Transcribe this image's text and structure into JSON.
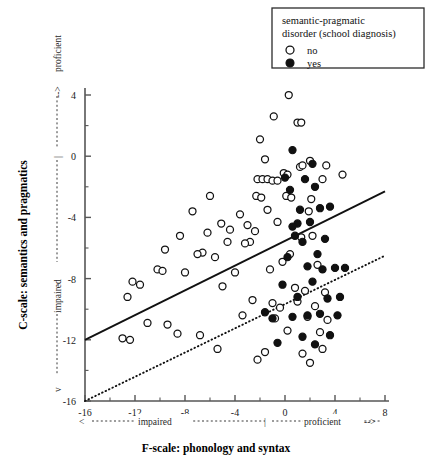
{
  "chart_data": {
    "type": "scatter",
    "title": "",
    "xlabel": "F-scale: phonology and syntax",
    "ylabel": "C-scale: semantics and pragmatics",
    "xlim": [
      -16,
      8
    ],
    "ylim": [
      -16,
      4
    ],
    "xticks": [
      -16,
      -12,
      -8,
      -4,
      0,
      4,
      8
    ],
    "yticks": [
      -16,
      -12,
      -8,
      -4,
      0,
      4
    ],
    "xtick_labels": [
      "-16",
      "-12",
      "-8",
      "-4",
      "0",
      "4",
      "8"
    ],
    "ytick_labels": [
      "-16",
      "-12",
      "-8",
      "-4",
      "0",
      "4"
    ],
    "minor_tick_step": 2,
    "grid": false,
    "x_axis_annotation": {
      "left_label": "impaired",
      "right_label": "proficient",
      "left_arrow": "<",
      "right_arrow": "-->",
      "midpoint_mark": "|"
    },
    "y_axis_annotation": {
      "low_label": "impaired",
      "high_label": "proficient",
      "low_arrow": "v",
      "high_arrow": "-->",
      "midpoint_mark": "|"
    },
    "legend": {
      "position": "top-right",
      "title_line1": "semantic-pragmatic",
      "title_line2": "disorder (school diagnosis)",
      "entries": [
        {
          "label": "no",
          "marker": "open-circle"
        },
        {
          "label": "yes",
          "marker": "filled-circle"
        }
      ]
    },
    "series": [
      {
        "name": "no",
        "marker": "open-circle",
        "color": "#ffffff",
        "edge_color": "#111111",
        "points": [
          [
            0.3,
            4.0
          ],
          [
            -0.9,
            2.6
          ],
          [
            1.0,
            2.2
          ],
          [
            1.3,
            2.2
          ],
          [
            -2.0,
            1.1
          ],
          [
            -1.6,
            -0.2
          ],
          [
            2.0,
            -0.3
          ],
          [
            1.2,
            -0.7
          ],
          [
            1.4,
            -0.6
          ],
          [
            3.3,
            -0.6
          ],
          [
            -0.1,
            -1.1
          ],
          [
            0.2,
            -1.2
          ],
          [
            -2.2,
            -1.5
          ],
          [
            -1.8,
            -1.5
          ],
          [
            -1.4,
            -1.5
          ],
          [
            -1.0,
            -1.6
          ],
          [
            -0.6,
            -1.6
          ],
          [
            3.0,
            -1.5
          ],
          [
            4.6,
            -1.2
          ],
          [
            -2.3,
            -2.6
          ],
          [
            -1.9,
            -2.7
          ],
          [
            0.1,
            -2.6
          ],
          [
            0.5,
            -2.7
          ],
          [
            2.1,
            -2.8
          ],
          [
            -6.0,
            -2.6
          ],
          [
            -1.4,
            -3.5
          ],
          [
            -3.6,
            -3.8
          ],
          [
            1.9,
            -3.6
          ],
          [
            -7.4,
            -3.6
          ],
          [
            -0.6,
            -4.3
          ],
          [
            -3.0,
            -4.5
          ],
          [
            -5.1,
            -4.4
          ],
          [
            -4.4,
            -4.8
          ],
          [
            -2.4,
            -4.9
          ],
          [
            -6.2,
            -5.0
          ],
          [
            -2.8,
            -5.6
          ],
          [
            -3.2,
            -5.7
          ],
          [
            -4.6,
            -5.6
          ],
          [
            -8.4,
            -5.2
          ],
          [
            1.3,
            -5.3
          ],
          [
            2.2,
            -5.2
          ],
          [
            -6.6,
            -6.3
          ],
          [
            -7.0,
            -6.4
          ],
          [
            -5.6,
            -6.6
          ],
          [
            -9.6,
            -6.1
          ],
          [
            0.4,
            -6.4
          ],
          [
            -0.2,
            -6.9
          ],
          [
            -10.2,
            -7.4
          ],
          [
            -9.8,
            -7.5
          ],
          [
            -8.0,
            -7.6
          ],
          [
            -4.0,
            -7.6
          ],
          [
            -1.2,
            -7.4
          ],
          [
            2.6,
            -7.1
          ],
          [
            -12.2,
            -8.2
          ],
          [
            -11.6,
            -8.4
          ],
          [
            -5.0,
            -8.5
          ],
          [
            0.8,
            -8.6
          ],
          [
            1.6,
            -8.8
          ],
          [
            3.2,
            -8.9
          ],
          [
            -2.6,
            -9.4
          ],
          [
            -1.0,
            -9.6
          ],
          [
            -0.4,
            -9.9
          ],
          [
            1.0,
            -9.5
          ],
          [
            2.4,
            -9.8
          ],
          [
            -12.6,
            -9.2
          ],
          [
            -3.4,
            -10.4
          ],
          [
            -0.8,
            -10.6
          ],
          [
            1.8,
            -10.5
          ],
          [
            3.4,
            -10.7
          ],
          [
            -11.0,
            -10.9
          ],
          [
            -9.4,
            -11.0
          ],
          [
            -8.6,
            -11.6
          ],
          [
            -6.8,
            -11.7
          ],
          [
            0.2,
            -11.4
          ],
          [
            2.8,
            -11.5
          ],
          [
            -13.0,
            -11.9
          ],
          [
            -12.4,
            -12.0
          ],
          [
            -5.4,
            -12.6
          ],
          [
            -1.6,
            -12.8
          ],
          [
            1.4,
            -12.9
          ],
          [
            3.0,
            -12.6
          ],
          [
            -2.2,
            -13.3
          ],
          [
            2.0,
            -13.5
          ]
        ]
      },
      {
        "name": "yes",
        "marker": "filled-circle",
        "color": "#111111",
        "edge_color": "#111111",
        "points": [
          [
            0.6,
            0.4
          ],
          [
            2.2,
            -0.5
          ],
          [
            0.0,
            -1.4
          ],
          [
            1.6,
            -1.5
          ],
          [
            2.4,
            -2.0
          ],
          [
            0.4,
            -2.2
          ],
          [
            2.8,
            -3.4
          ],
          [
            3.6,
            -3.3
          ],
          [
            1.2,
            -3.5
          ],
          [
            1.0,
            -4.4
          ],
          [
            0.6,
            -4.6
          ],
          [
            2.0,
            -4.3
          ],
          [
            0.8,
            -5.2
          ],
          [
            1.4,
            -5.6
          ],
          [
            3.2,
            -5.4
          ],
          [
            2.6,
            -6.4
          ],
          [
            0.2,
            -6.6
          ],
          [
            1.8,
            -7.2
          ],
          [
            3.0,
            -7.4
          ],
          [
            4.0,
            -7.3
          ],
          [
            4.8,
            -7.3
          ],
          [
            2.2,
            -8.2
          ],
          [
            -0.2,
            -8.4
          ],
          [
            1.0,
            -9.2
          ],
          [
            3.4,
            -9.3
          ],
          [
            4.4,
            -9.2
          ],
          [
            -1.6,
            -10.2
          ],
          [
            -1.0,
            -10.6
          ],
          [
            0.6,
            -10.5
          ],
          [
            1.8,
            -10.4
          ],
          [
            2.8,
            -10.3
          ],
          [
            4.2,
            -10.4
          ],
          [
            1.4,
            -11.8
          ],
          [
            3.6,
            -11.7
          ],
          [
            -0.6,
            -12.2
          ],
          [
            2.4,
            -12.3
          ]
        ]
      }
    ],
    "fit_lines": [
      {
        "name": "no",
        "style": "solid",
        "x_start": -16,
        "y_start": -12.0,
        "x_end": 8,
        "y_end": -2.3
      },
      {
        "name": "yes",
        "style": "dotted",
        "x_start": -16,
        "y_start": -16.0,
        "x_end": 8,
        "y_end": -6.5
      }
    ]
  }
}
